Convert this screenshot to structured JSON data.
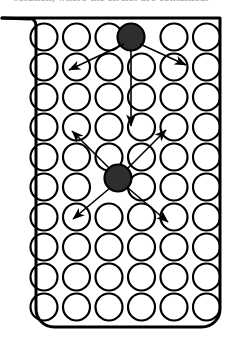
{
  "figure": {
    "caption_partial": "solution, where the circles are contained.",
    "ink_color": "#000000",
    "fill_color": "#2e2e2e",
    "background_color": "#ffffff"
  },
  "container": {
    "name": "beaker",
    "spout_label": "pouring-spout",
    "left": 22,
    "right": 222,
    "top": 14,
    "bottom": 325,
    "corner_radius": 16,
    "stroke_width": 3
  },
  "grid": {
    "rows": 10,
    "columns": 6,
    "circle_radius": 13.5,
    "x_start": 44,
    "x_step": 32.5,
    "y_start": 37,
    "y_step": 30,
    "stroke_width": 2.2
  },
  "particles": [
    {
      "id": "particle-top",
      "label": "highlighted-particle-upper",
      "row": 0,
      "col": 3,
      "cx": 131,
      "cy": 37,
      "r": 13.5,
      "filled": true
    },
    {
      "id": "particle-middle",
      "label": "highlighted-particle-lower",
      "row": 5,
      "col": 2,
      "cx": 118,
      "cy": 178,
      "r": 13.5,
      "filled": true
    }
  ],
  "arrows": [
    {
      "id": "arrow-top-downleft",
      "from_particle": "particle-top",
      "direction": "down-left",
      "x1": 124,
      "y1": 44,
      "x2": 69,
      "y2": 70
    },
    {
      "id": "arrow-top-downright",
      "from_particle": "particle-top",
      "direction": "down-right",
      "x1": 140,
      "y1": 44,
      "x2": 186,
      "y2": 65
    },
    {
      "id": "arrow-top-down",
      "from_particle": "particle-top",
      "direction": "down",
      "x1": 131,
      "y1": 50,
      "x2": 131,
      "y2": 126
    },
    {
      "id": "arrow-mid-upleft",
      "from_particle": "particle-middle",
      "direction": "up-left",
      "x1": 110,
      "y1": 169,
      "x2": 72,
      "y2": 131
    },
    {
      "id": "arrow-mid-upright",
      "from_particle": "particle-middle",
      "direction": "up-right",
      "x1": 127,
      "y1": 169,
      "x2": 166,
      "y2": 130
    },
    {
      "id": "arrow-mid-downleft",
      "from_particle": "particle-middle",
      "direction": "down-left",
      "x1": 110,
      "y1": 188,
      "x2": 73,
      "y2": 219
    },
    {
      "id": "arrow-mid-downright",
      "from_particle": "particle-middle",
      "direction": "down-right",
      "x1": 128,
      "y1": 188,
      "x2": 168,
      "y2": 222
    }
  ]
}
